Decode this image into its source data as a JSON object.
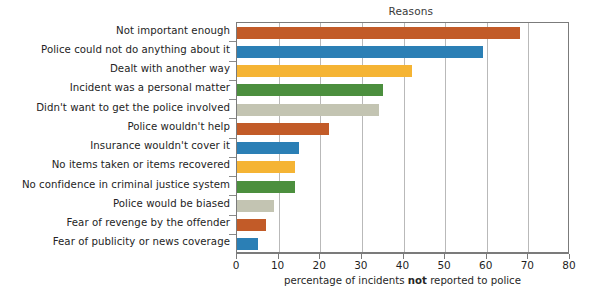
{
  "chart_data": {
    "type": "bar",
    "orientation": "horizontal",
    "title": "Reasons",
    "xlabel_prefix": "percentage of incidents ",
    "xlabel_emphasis": "not",
    "xlabel_suffix": " reported to police",
    "ylabel": "",
    "xlim": [
      0,
      80
    ],
    "xticks": [
      0,
      10,
      20,
      30,
      40,
      50,
      60,
      70,
      80
    ],
    "xtick_labels": [
      "0",
      "10",
      "20",
      "30",
      "40",
      "50",
      "60",
      "70",
      "80"
    ],
    "grid": "vertical",
    "legend": "none",
    "categories": [
      "Not important enough",
      "Police could not do anything about it",
      "Dealt with another way",
      "Incident was a personal matter",
      "Didn't want to get the police involved",
      "Police wouldn't help",
      "Insurance wouldn't cover it",
      "No items taken or items recovered",
      "No confidence in criminal justice system",
      "Police would be biased",
      "Fear of revenge by the offender",
      "Fear of publicity or news coverage"
    ],
    "values": [
      68,
      59,
      42,
      35,
      34,
      22,
      15,
      14,
      14,
      9,
      7,
      5
    ],
    "bar_colors": [
      "#c25b28",
      "#2b7fb5",
      "#f5b434",
      "#4c8f3e",
      "#c3c4b2",
      "#c25b28",
      "#2b7fb5",
      "#f5b434",
      "#4c8f3e",
      "#c3c4b2",
      "#c25b28",
      "#2b7fb5"
    ],
    "palette": {
      "orange": "#c25b28",
      "blue": "#2b7fb5",
      "yellow": "#f5b434",
      "green": "#4c8f3e",
      "khaki": "#c3c4b2"
    },
    "axis_color": "#7b7b7b",
    "gridline_color": "#b9b9b9"
  }
}
